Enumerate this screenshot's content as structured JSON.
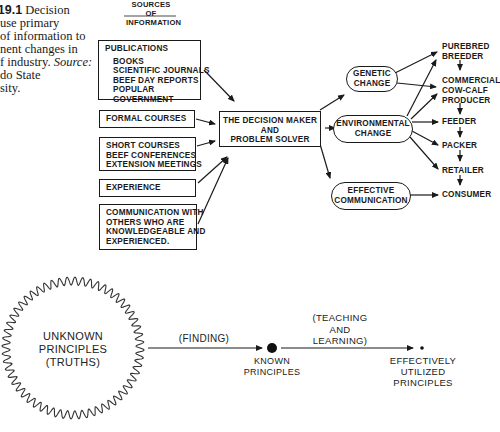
{
  "caption": {
    "figure_label": "E 19.1",
    "lines": [
      "Decision",
      "use primary",
      "of information to",
      "nent changes in",
      "f industry.",
      "do State",
      "sity."
    ],
    "source_label": "Source:"
  },
  "top_diagram": {
    "sources_heading": [
      "SOURCES OF",
      "INFORMATION"
    ],
    "sources": [
      {
        "title": "PUBLICATIONS",
        "items": [
          "BOOKS",
          "SCIENTIFIC JOURNALS",
          "BEEF DAY REPORTS",
          "POPULAR",
          "GOVERNMENT"
        ]
      },
      {
        "title": "FORMAL COURSES",
        "items": []
      },
      {
        "title": "",
        "items": [
          "SHORT COURSES",
          "BEEF CONFERENCES",
          "EXTENSION MEETINGS"
        ]
      },
      {
        "title": "EXPERIENCE",
        "items": []
      },
      {
        "title": "",
        "items": [
          "COMMUNICATION WITH",
          "OTHERS WHO ARE",
          "KNOWLEDGEABLE AND",
          "EXPERIENCED."
        ]
      }
    ],
    "center": [
      "THE DECISION MAKER",
      "AND",
      "PROBLEM SOLVER"
    ],
    "changes": [
      [
        "GENETIC",
        "CHANGE"
      ],
      [
        "ENVIRONMENTAL",
        "CHANGE"
      ],
      [
        "EFFECTIVE",
        "COMMUNICATION"
      ]
    ],
    "chain": [
      [
        "PUREBRED",
        "BREEDER"
      ],
      [
        "COMMERCIAL",
        "COW-CALF",
        "PRODUCER"
      ],
      [
        "FEEDER"
      ],
      [
        "PACKER"
      ],
      [
        "RETAILER"
      ],
      [
        "CONSUMER"
      ]
    ]
  },
  "bottom_diagram": {
    "unknown": [
      "UNKNOWN",
      "PRINCIPLES",
      "(TRUTHS)"
    ],
    "finding": "(FINDING)",
    "known": [
      "KNOWN",
      "PRINCIPLES"
    ],
    "teaching": [
      "(TEACHING",
      "AND",
      "LEARNING)"
    ],
    "utilized": [
      "EFFECTIVELY",
      "UTILIZED",
      "PRINCIPLES"
    ]
  }
}
